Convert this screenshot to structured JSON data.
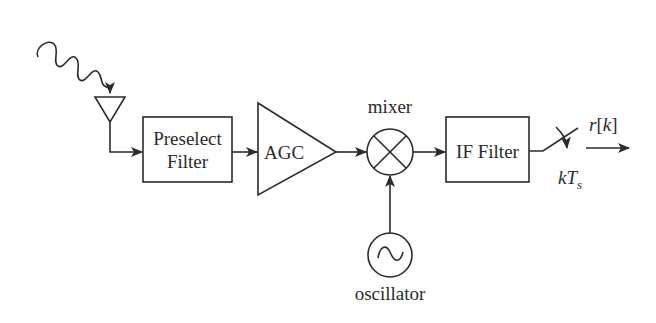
{
  "diagram": {
    "blocks": {
      "preselect_filter": {
        "line1": "Preselect",
        "line2": "Filter"
      },
      "agc": {
        "label": "AGC"
      },
      "mixer": {
        "label": "mixer"
      },
      "oscillator": {
        "label": "oscillator"
      },
      "if_filter": {
        "label": "IF Filter"
      }
    },
    "sampler": {
      "output_label_r": "r",
      "output_label_open": "[",
      "output_label_k": "k",
      "output_label_close": "]",
      "sample_time_k": "k",
      "sample_time_T": "T",
      "sample_time_sub": "s"
    },
    "signal_flow": [
      "antenna",
      "Preselect Filter",
      "AGC",
      "mixer",
      "IF Filter",
      "sampler",
      "r[k]"
    ],
    "colors": {
      "ink": "#2b2b2b",
      "background": "#ffffff"
    }
  }
}
